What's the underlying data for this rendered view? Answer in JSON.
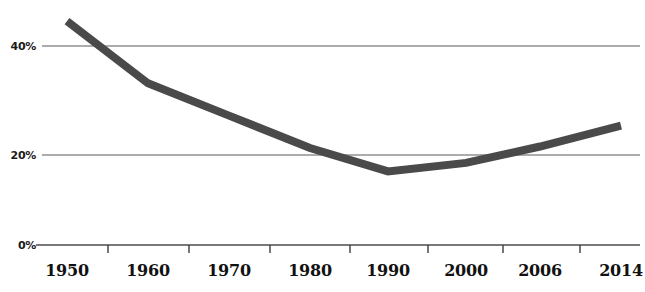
{
  "chart_data": {
    "type": "line",
    "title": "",
    "subtitle": "",
    "xlabel": "",
    "ylabel": "",
    "categories": [
      "1950",
      "1960",
      "1970",
      "1980",
      "1990",
      "2000",
      "2006",
      "2014"
    ],
    "values": [
      45,
      32.5,
      26,
      19.5,
      14.8,
      16.5,
      19.8,
      24
    ],
    "series": [
      {
        "name": "",
        "values": [
          45,
          32.5,
          26,
          19.5,
          14.8,
          16.5,
          19.8,
          24
        ]
      }
    ],
    "ylim": [
      0,
      50
    ],
    "yticks": [
      0,
      20,
      40
    ],
    "ytick_labels": [
      "0%",
      "20%",
      "40%"
    ],
    "xtick_labels": [
      "1950",
      "1960",
      "1970",
      "1980",
      "1990",
      "2000",
      "2006",
      "2014"
    ],
    "grid": true,
    "gridlines_at": [
      0,
      20,
      40
    ],
    "legend": null,
    "legend_position": "none",
    "annotations": [],
    "line_color": "#4a4a4a",
    "line_width": 8,
    "axis_color": "#555555",
    "text_color": "#111111",
    "background_color": "#ffffff"
  },
  "axes": {
    "y": {
      "ticks": [
        {
          "label": "40%",
          "value": 40
        },
        {
          "label": "20%",
          "value": 20
        },
        {
          "label": "0%",
          "value": 0
        }
      ]
    },
    "x": {
      "ticks": [
        {
          "label": "1950"
        },
        {
          "label": "1960"
        },
        {
          "label": "1970"
        },
        {
          "label": "1980"
        },
        {
          "label": "1990"
        },
        {
          "label": "2000"
        },
        {
          "label": "2006"
        },
        {
          "label": "2014"
        }
      ]
    }
  }
}
